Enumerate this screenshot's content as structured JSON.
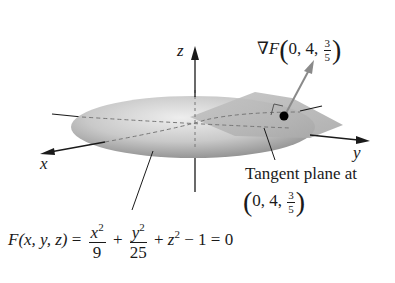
{
  "figure": {
    "axes": {
      "x_label": "x",
      "y_label": "y",
      "z_label": "z"
    },
    "gradient_label": {
      "prefix": "∇F",
      "point": {
        "x": "0",
        "y": "4",
        "z_num": "3",
        "z_den": "5"
      }
    },
    "tangent_plane_label": {
      "text": "Tangent plane at",
      "point": {
        "x": "0",
        "y": "4",
        "z_num": "3",
        "z_den": "5"
      }
    },
    "equation": {
      "lhs": "F(x, y, z)",
      "equals": "=",
      "term1": {
        "num": "x",
        "num_exp": "2",
        "den": "9"
      },
      "plus1": "+",
      "term2": {
        "num": "y",
        "num_exp": "2",
        "den": "25"
      },
      "plus2": "+",
      "term3": {
        "base": "z",
        "exp": "2"
      },
      "minus": "− 1",
      "rhs": "= 0"
    },
    "colors": {
      "surface_light": "#e6e6e6",
      "surface_dark": "#8f8f8f",
      "plane": "#b5b5b5",
      "axis": "#1a1a1a",
      "gradient_arrow": "#8a8a8a"
    }
  }
}
